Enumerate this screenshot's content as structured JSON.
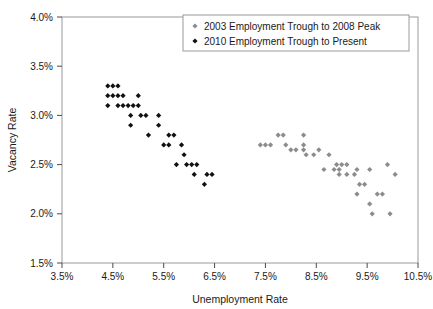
{
  "chart_data": {
    "type": "scatter",
    "title": "",
    "xlabel": "Unemployment Rate",
    "ylabel": "Vacancy Rate",
    "xlim": [
      3.5,
      10.5
    ],
    "ylim": [
      1.5,
      4.0
    ],
    "xticks": [
      "3.5%",
      "4.5%",
      "5.5%",
      "6.5%",
      "7.5%",
      "8.5%",
      "9.5%",
      "10.5%"
    ],
    "xtick_values": [
      3.5,
      4.5,
      5.5,
      6.5,
      7.5,
      8.5,
      9.5,
      10.5
    ],
    "yticks": [
      "1.5%",
      "2.0%",
      "2.5%",
      "3.0%",
      "3.5%",
      "4.0%"
    ],
    "ytick_values": [
      1.5,
      2.0,
      2.5,
      3.0,
      3.5,
      4.0
    ],
    "grid": false,
    "legend_position": "top-right",
    "marker": "diamond",
    "series": [
      {
        "name": "2003 Employment Trough to 2008 Peak",
        "color": "#8c8c8c",
        "points": [
          [
            7.4,
            2.7
          ],
          [
            7.5,
            2.7
          ],
          [
            7.6,
            2.7
          ],
          [
            7.75,
            2.8
          ],
          [
            7.85,
            2.8
          ],
          [
            7.9,
            2.7
          ],
          [
            8.0,
            2.65
          ],
          [
            8.1,
            2.65
          ],
          [
            8.25,
            2.8
          ],
          [
            8.25,
            2.7
          ],
          [
            8.25,
            2.65
          ],
          [
            8.3,
            2.6
          ],
          [
            8.45,
            2.6
          ],
          [
            8.55,
            2.65
          ],
          [
            8.75,
            2.6
          ],
          [
            8.9,
            2.5
          ],
          [
            9.0,
            2.5
          ],
          [
            9.1,
            2.5
          ],
          [
            8.65,
            2.45
          ],
          [
            8.85,
            2.45
          ],
          [
            8.95,
            2.45
          ],
          [
            9.3,
            2.45
          ],
          [
            9.55,
            2.45
          ],
          [
            9.9,
            2.5
          ],
          [
            8.95,
            2.4
          ],
          [
            9.1,
            2.4
          ],
          [
            9.25,
            2.4
          ],
          [
            9.35,
            2.3
          ],
          [
            9.45,
            2.3
          ],
          [
            9.3,
            2.2
          ],
          [
            9.7,
            2.2
          ],
          [
            9.8,
            2.2
          ],
          [
            9.55,
            2.1
          ],
          [
            9.6,
            2.0
          ],
          [
            9.95,
            2.0
          ],
          [
            10.05,
            2.4
          ]
        ]
      },
      {
        "name": "2010 Employment Trough to Present",
        "color": "#111111",
        "points": [
          [
            4.4,
            3.3
          ],
          [
            4.5,
            3.3
          ],
          [
            4.6,
            3.3
          ],
          [
            4.4,
            3.2
          ],
          [
            4.5,
            3.2
          ],
          [
            4.6,
            3.2
          ],
          [
            4.7,
            3.2
          ],
          [
            5.0,
            3.2
          ],
          [
            4.4,
            3.1
          ],
          [
            4.6,
            3.1
          ],
          [
            4.7,
            3.1
          ],
          [
            4.8,
            3.1
          ],
          [
            4.9,
            3.1
          ],
          [
            5.0,
            3.1
          ],
          [
            4.85,
            3.0
          ],
          [
            5.05,
            3.0
          ],
          [
            5.15,
            3.0
          ],
          [
            5.4,
            3.0
          ],
          [
            4.85,
            2.9
          ],
          [
            5.4,
            2.9
          ],
          [
            5.2,
            2.8
          ],
          [
            5.6,
            2.8
          ],
          [
            5.7,
            2.8
          ],
          [
            5.5,
            2.7
          ],
          [
            5.6,
            2.7
          ],
          [
            5.85,
            2.7
          ],
          [
            5.9,
            2.6
          ],
          [
            5.75,
            2.5
          ],
          [
            5.95,
            2.5
          ],
          [
            6.05,
            2.5
          ],
          [
            6.15,
            2.5
          ],
          [
            6.1,
            2.4
          ],
          [
            6.35,
            2.4
          ],
          [
            6.45,
            2.4
          ],
          [
            6.3,
            2.3
          ]
        ]
      }
    ]
  },
  "legend": {
    "items": [
      {
        "label": "2003 Employment Trough to 2008 Peak",
        "color": "#8c8c8c"
      },
      {
        "label": "2010 Employment Trough to Present",
        "color": "#111111"
      }
    ]
  }
}
